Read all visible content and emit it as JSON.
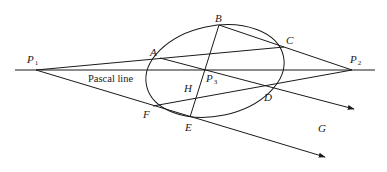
{
  "diagram": {
    "title": "Pascal line",
    "points": {
      "P1": {
        "label": "P",
        "sub": "1"
      },
      "P2": {
        "label": "P",
        "sub": "2"
      },
      "P3": {
        "label": "P",
        "sub": "3"
      },
      "A": {
        "label": "A"
      },
      "B": {
        "label": "B"
      },
      "C": {
        "label": "C"
      },
      "D": {
        "label": "D"
      },
      "E": {
        "label": "E"
      },
      "F": {
        "label": "F"
      },
      "G": {
        "label": "G"
      },
      "H": {
        "label": "H"
      }
    },
    "line_label": "Pascal line",
    "colors": {
      "stroke": "#1a1a1a",
      "background": "#ffffff"
    }
  }
}
